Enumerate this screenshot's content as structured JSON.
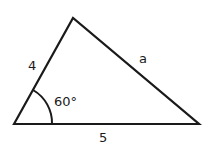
{
  "diagram": {
    "type": "triangle",
    "vertices": {
      "left": [
        14,
        124
      ],
      "apex": [
        73,
        18
      ],
      "right": [
        199,
        124
      ]
    },
    "stroke_color": "#1a1a1a",
    "background": "#ffffff",
    "labels": {
      "side_left": "4",
      "side_right": "a",
      "side_base": "5",
      "angle": "60°"
    },
    "angle_marker": {
      "vertex": "left",
      "radius": 38,
      "degrees": 60
    }
  }
}
